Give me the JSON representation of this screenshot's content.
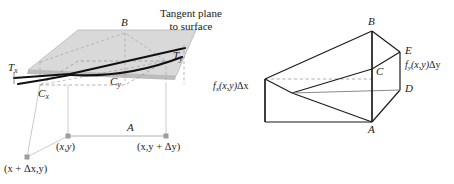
{
  "figure": {
    "background_color": "#ffffff",
    "ink_color": "#1a1a1a",
    "plane_fill": "#d4d4d4",
    "plane_fill_light": "#e6e6e6",
    "dash_color": "#9a9a9a",
    "panels": [
      {
        "id": "tangent-plane-panel",
        "caption": {
          "line1": "Tangent plane",
          "line2": "to surface"
        },
        "labels": {
          "point_b": "B",
          "tangent_x": "T",
          "tangent_x_sub": "x",
          "tangent_y": "T",
          "tangent_y_sub": "y",
          "curve_x": "C",
          "curve_x_sub": "x",
          "curve_y": "C",
          "curve_y_sub": "y",
          "point_a": "A"
        },
        "base_points": [
          {
            "name": "xy",
            "text_pre": "(",
            "text_x": "x",
            "text_mid": ",",
            "text_y": "y",
            "text_post": ")"
          },
          {
            "name": "xy-plus-dy",
            "label": "(x,y + Δy)"
          },
          {
            "name": "x-plus-dx-y",
            "label": "(x + Δx,y)"
          }
        ]
      },
      {
        "id": "prism-panel",
        "labels": {
          "point_a": "A",
          "point_b": "B",
          "point_c": "C",
          "point_d": "D",
          "point_e": "E"
        },
        "annotations": {
          "fx": {
            "f": "f",
            "sub": "x",
            "arg": "(x,y)",
            "delta": "Δx"
          },
          "fy": {
            "f": "f",
            "sub": "y",
            "arg": "(x,y)",
            "delta": "Δy"
          }
        }
      }
    ]
  }
}
